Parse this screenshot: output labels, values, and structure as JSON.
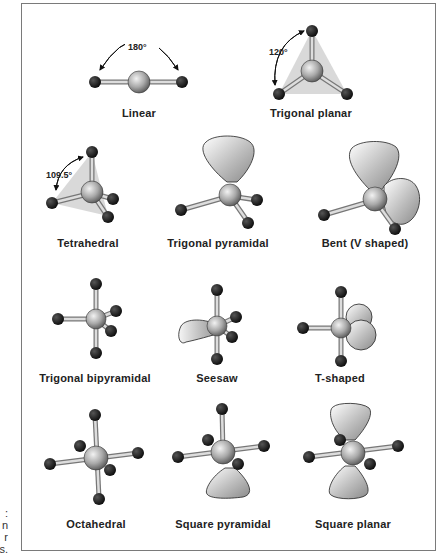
{
  "figure": {
    "caption_fragments": [
      ":",
      "n",
      "r",
      "s."
    ],
    "shapes": [
      {
        "name": "Linear",
        "angle": "180°"
      },
      {
        "name": "Trigonal planar",
        "angle": "120°"
      },
      {
        "name": "Tetrahedral",
        "angle": "109.5°"
      },
      {
        "name": "Trigonal pyramidal"
      },
      {
        "name": "Bent (V shaped)"
      },
      {
        "name": "Trigonal bipyramidal"
      },
      {
        "name": "Seesaw"
      },
      {
        "name": "T-shaped"
      },
      {
        "name": "Octahedral"
      },
      {
        "name": "Square pyramidal"
      },
      {
        "name": "Square planar"
      }
    ]
  }
}
